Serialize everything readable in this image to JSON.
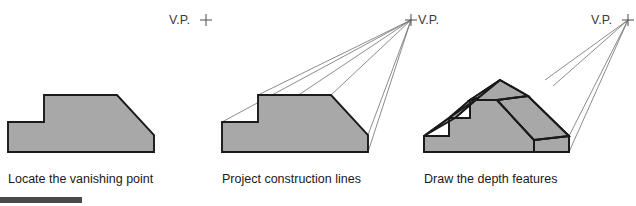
{
  "figure": {
    "background_color": "#ffffff",
    "fill_color": "#a8a8a8",
    "outline_color": "#1a1a1a",
    "construction_line_color": "#6e6e6e",
    "footer_bar_color": "#4a4a4a"
  },
  "panels": [
    {
      "index": 1,
      "caption": "Locate the vanishing point",
      "vp_label": "V.P.",
      "vp_marker": "plus-crosshair",
      "vp_label_side": "left-of-marker",
      "has_construction_lines": false,
      "has_depth": false
    },
    {
      "index": 2,
      "caption": "Project construction lines",
      "vp_label": "V.P.",
      "vp_marker": "plus-crosshair",
      "vp_label_side": "right-of-marker",
      "has_construction_lines": true,
      "has_depth": false
    },
    {
      "index": 3,
      "caption": "Draw the depth features",
      "vp_label": "V.P.",
      "vp_marker": "plus-crosshair",
      "vp_label_side": "left-of-marker",
      "has_construction_lines": true,
      "has_depth": true
    }
  ]
}
